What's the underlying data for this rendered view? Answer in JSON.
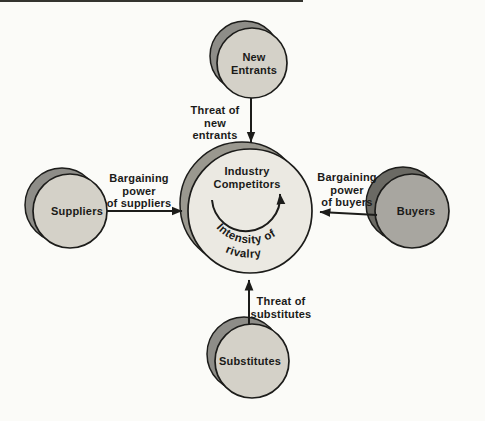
{
  "nodes": {
    "new_entrants": "New\nEntrants",
    "suppliers": "Suppliers",
    "buyers": "Buyers",
    "substitutes": "Substitutes",
    "center": "Industry\nCompetitors"
  },
  "forces": {
    "threat_new_entrants": "Threat of\nnew\nentrants",
    "bargaining_suppliers": "Bargaining\npower\nof suppliers",
    "bargaining_buyers": "Bargaining\npower\nof buyers",
    "threat_substitutes": "Threat of\nsubstitutes",
    "rivalry_line1": "Intensity of",
    "rivalry_line2": "rivalry"
  },
  "colors": {
    "background": "#fbfbf8",
    "node_fill_light": "#d4d1c8",
    "node_fill_dark": "#a8a6a0",
    "center_fill": "#ebe9e2",
    "shadow_light": "#8e8d88",
    "shadow_dark": "#6b6a64",
    "shadow_center": "#9a988f",
    "stroke": "#1c1c1a",
    "text": "#1a1a18"
  }
}
